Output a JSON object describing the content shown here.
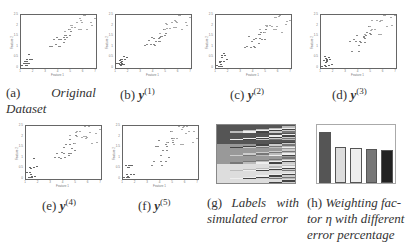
{
  "figure": {
    "panels": [
      {
        "id": "a",
        "label": "(a)",
        "caption_text": "Original Dataset",
        "caption_style": "italic"
      },
      {
        "id": "b",
        "label": "(b)",
        "caption_var": "y",
        "caption_sup": "(1)"
      },
      {
        "id": "c",
        "label": "(c)",
        "caption_var": "y",
        "caption_sup": "(2)"
      },
      {
        "id": "d",
        "label": "(d)",
        "caption_var": "y",
        "caption_sup": "(3)"
      },
      {
        "id": "e",
        "label": "(e)",
        "caption_var": "y",
        "caption_sup": "(4)"
      },
      {
        "id": "f",
        "label": "(f)",
        "caption_var": "y",
        "caption_sup": "(5)"
      },
      {
        "id": "g",
        "label": "(g)",
        "caption_line1": "Labels with",
        "caption_line2": "simulated error"
      },
      {
        "id": "h",
        "label": "(h)",
        "caption_line1": "Weighting fac-",
        "caption_line2": "tor η with different",
        "caption_line3": "error percentage"
      }
    ],
    "captions": {
      "a_label": "(a)",
      "a_word1": "Original",
      "a_word2": "Dataset",
      "b_label": "(b)",
      "b_var": "y",
      "b_sup": "(1)",
      "c_label": "(c)",
      "c_var": "y",
      "c_sup": "(2)",
      "d_label": "(d)",
      "d_var": "y",
      "d_sup": "(3)",
      "e_label": "(e)",
      "e_var": "y",
      "e_sup": "(4)",
      "f_label": "(f)",
      "f_var": "y",
      "f_sup": "(5)",
      "g_label": "(g)",
      "g_word1": "Labels",
      "g_word2": "with",
      "g_line2": "simulated error",
      "h_label": "(h)",
      "h_line1": "Weighting fac-",
      "h_line2": "tor η with different",
      "h_line3": "error percentage"
    },
    "scatter_axes": {
      "xlabel": "Feature 1",
      "ylabel": "Feature 2",
      "xticks": [
        "1",
        "2",
        "3",
        "4",
        "5",
        "6",
        "7"
      ],
      "yticks": [
        "0",
        "0.5",
        "1",
        "1.5",
        "2",
        "2.5"
      ]
    }
  },
  "chart_data": [
    {
      "panel": "a",
      "type": "scatter",
      "title": "",
      "xlabel": "Feature 1",
      "ylabel": "Feature 2",
      "xlim": [
        1,
        7
      ],
      "ylim": [
        0,
        2.5
      ],
      "grid": false,
      "series": [
        {
          "name": "class 1",
          "points": [
            [
              1.4,
              0.2
            ],
            [
              1.3,
              0.2
            ],
            [
              1.5,
              0.2
            ],
            [
              1.4,
              0.3
            ],
            [
              1.7,
              0.4
            ],
            [
              1.5,
              0.1
            ],
            [
              1.6,
              0.2
            ],
            [
              1.2,
              0.2
            ],
            [
              1.9,
              0.4
            ],
            [
              1.5,
              0.4
            ],
            [
              1.3,
              0.3
            ],
            [
              1.6,
              0.6
            ],
            [
              1.4,
              0.1
            ],
            [
              1.1,
              0.1
            ],
            [
              1.5,
              0.3
            ]
          ]
        },
        {
          "name": "class 2",
          "points": [
            [
              4.7,
              1.4
            ],
            [
              4.5,
              1.5
            ],
            [
              4.9,
              1.5
            ],
            [
              4.0,
              1.3
            ],
            [
              4.6,
              1.5
            ],
            [
              3.3,
              1.0
            ],
            [
              4.2,
              1.3
            ],
            [
              3.9,
              1.4
            ],
            [
              3.5,
              1.0
            ],
            [
              4.4,
              1.4
            ],
            [
              4.1,
              1.0
            ],
            [
              4.5,
              1.3
            ],
            [
              4.8,
              1.8
            ],
            [
              4.0,
              1.0
            ],
            [
              3.6,
              1.3
            ],
            [
              4.4,
              1.2
            ],
            [
              5.0,
              1.7
            ],
            [
              3.8,
              1.1
            ]
          ]
        },
        {
          "name": "class 3",
          "points": [
            [
              6.0,
              2.5
            ],
            [
              5.1,
              1.9
            ],
            [
              5.9,
              2.1
            ],
            [
              5.6,
              1.8
            ],
            [
              5.8,
              2.2
            ],
            [
              6.6,
              2.1
            ],
            [
              4.5,
              1.7
            ],
            [
              6.3,
              1.8
            ],
            [
              5.8,
              1.8
            ],
            [
              6.1,
              2.5
            ],
            [
              5.1,
              2.0
            ],
            [
              5.3,
              1.9
            ],
            [
              5.5,
              2.1
            ],
            [
              5.0,
              2.0
            ],
            [
              6.7,
              2.0
            ],
            [
              6.9,
              2.3
            ],
            [
              5.7,
              2.3
            ],
            [
              4.9,
              1.8
            ]
          ]
        }
      ]
    },
    {
      "panel": "b",
      "type": "scatter",
      "xlabel": "Feature 1",
      "ylabel": "Feature 2",
      "xlim": [
        1,
        7
      ],
      "ylim": [
        0,
        2.5
      ],
      "note": "same data as (a), labels y(1) with simulated error"
    },
    {
      "panel": "c",
      "type": "scatter",
      "xlabel": "Feature 1",
      "ylabel": "Feature 2",
      "xlim": [
        1,
        7
      ],
      "ylim": [
        0,
        2.5
      ],
      "note": "labels y(2)"
    },
    {
      "panel": "d",
      "type": "scatter",
      "xlabel": "Feature 1",
      "ylabel": "Feature 2",
      "xlim": [
        1,
        7
      ],
      "ylim": [
        0,
        2.5
      ],
      "note": "labels y(3)"
    },
    {
      "panel": "e",
      "type": "scatter",
      "xlabel": "Feature 1",
      "ylabel": "Feature 2",
      "xlim": [
        1,
        7
      ],
      "ylim": [
        0,
        2.5
      ],
      "note": "labels y(4)"
    },
    {
      "panel": "f",
      "type": "scatter",
      "xlabel": "Feature 1",
      "ylabel": "Feature 2",
      "xlim": [
        1,
        7
      ],
      "ylim": [
        0,
        2.5
      ],
      "note": "labels y(5)"
    },
    {
      "panel": "g",
      "type": "heatmap",
      "title": "Labels with simulated error",
      "columns": [
        "y",
        "y(1)",
        "y(2)",
        "y(3)",
        "y(4)",
        "y(5)"
      ],
      "row_bands": [
        "class 1 (dark)",
        "class 2 (medium)",
        "class 3 (light)"
      ],
      "colors": {
        "class1": "#555555",
        "class2": "#999999",
        "class3": "#dddddd"
      }
    },
    {
      "panel": "h",
      "type": "bar",
      "title": "Weighting factor η with different error percentage",
      "categories": [
        "1",
        "2",
        "3",
        "4",
        "5"
      ],
      "values": [
        0.31,
        0.22,
        0.21,
        0.205,
        0.2
      ],
      "ylim": [
        0,
        0.35
      ],
      "bar_colors": [
        "#555555",
        "#dddddd",
        "#eeeeee",
        "#777777",
        "#222222"
      ]
    }
  ]
}
